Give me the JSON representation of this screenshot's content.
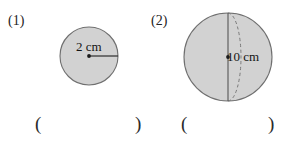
{
  "page": {
    "width": 286,
    "height": 146,
    "background": "#ffffff",
    "kind": "math-worksheet-figures"
  },
  "style": {
    "shape_fill": "#d2d2d2",
    "shape_stroke": "#6f6f6f",
    "line_color": "#2b2b2b",
    "dashed_color": "#7a7a7a",
    "text_color": "#1b1b1b"
  },
  "problems": [
    {
      "number": "(1)",
      "figure": {
        "shape_name": "circle",
        "fill": "#d2d2d2",
        "stroke": "#6f6f6f",
        "center_dot": true,
        "measure_kind": "radius",
        "measure_label": "2 cm",
        "measure_value": 2,
        "measure_unit": "cm"
      },
      "answer": {
        "open_paren": "(",
        "close_paren": ")",
        "value": ""
      }
    },
    {
      "number": "(2)",
      "figure": {
        "shape_name": "sphere",
        "fill": "#d2d2d2",
        "stroke": "#6f6f6f",
        "center_dot": true,
        "has_dashed_equator_arc": true,
        "has_vertical_axis_line": true,
        "measure_kind": "diameter",
        "measure_label": "10 cm",
        "measure_value": 10,
        "measure_unit": "cm"
      },
      "answer": {
        "open_paren": "(",
        "close_paren": ")",
        "value": ""
      }
    }
  ]
}
